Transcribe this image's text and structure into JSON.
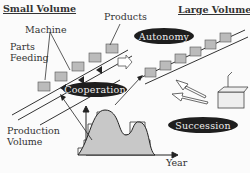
{
  "labels": {
    "small_volume": "Small Volume",
    "large_volume": "Large Volume",
    "machine": "Machine",
    "products": "Products",
    "parts_feeding": "Parts\nFeeding",
    "parts": "Parts",
    "feeding": "Feeding",
    "production": "Production",
    "volume": "Volume",
    "year": "Year"
  },
  "pills": {
    "autonomy": "Autonomy",
    "cooperation": "Cooperation",
    "succession": "Succession"
  },
  "colors": {
    "pill_bg": "#1e1e1e",
    "curve_fill": "#c8c8c8",
    "line": "#333333"
  }
}
